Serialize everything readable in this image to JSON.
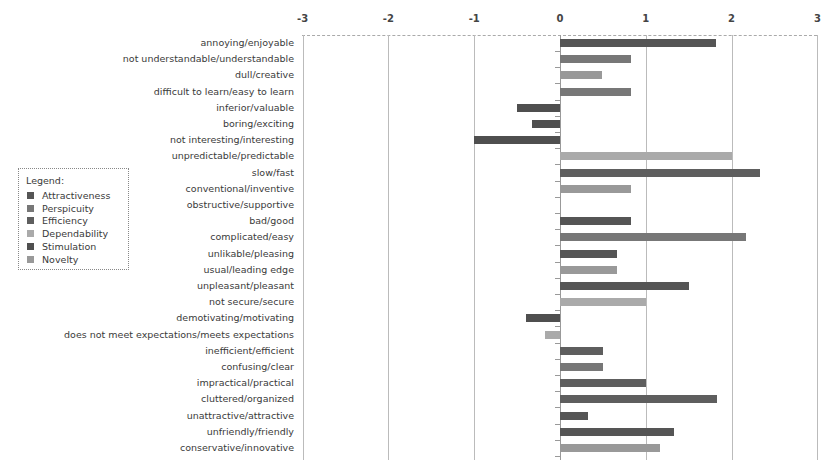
{
  "chart_data": {
    "type": "bar",
    "orientation": "horizontal",
    "title": "",
    "xlabel": "",
    "ylabel": "",
    "xlim": [
      -3,
      3
    ],
    "x_ticks": [
      "-3",
      "-2",
      "-1",
      "0",
      "1",
      "2",
      "3"
    ],
    "grid": true,
    "legend_position": "left",
    "legend_title": "Legend:",
    "scales": [
      {
        "name": "Attractiveness",
        "color": "#555555"
      },
      {
        "name": "Perspicuity",
        "color": "#777777"
      },
      {
        "name": "Efficiency",
        "color": "#5e5e5e"
      },
      {
        "name": "Dependability",
        "color": "#aaaaaa"
      },
      {
        "name": "Stimulation",
        "color": "#4f4f4f"
      },
      {
        "name": "Novelty",
        "color": "#999999"
      }
    ],
    "items": [
      {
        "label": "annoying/enjoyable",
        "value": 1.82,
        "scale": "Attractiveness"
      },
      {
        "label": "not understandable/understandable",
        "value": 0.83,
        "scale": "Perspicuity"
      },
      {
        "label": "dull/creative",
        "value": 0.49,
        "scale": "Novelty"
      },
      {
        "label": "difficult to learn/easy to learn",
        "value": 0.83,
        "scale": "Perspicuity"
      },
      {
        "label": "inferior/valuable",
        "value": -0.5,
        "scale": "Stimulation"
      },
      {
        "label": "boring/exciting",
        "value": -0.33,
        "scale": "Stimulation"
      },
      {
        "label": "not interesting/interesting",
        "value": -1.0,
        "scale": "Stimulation"
      },
      {
        "label": "unpredictable/predictable",
        "value": 2.0,
        "scale": "Dependability"
      },
      {
        "label": "slow/fast",
        "value": 2.33,
        "scale": "Efficiency"
      },
      {
        "label": "conventional/inventive",
        "value": 0.83,
        "scale": "Novelty"
      },
      {
        "label": "obstructive/supportive",
        "value": 0.0,
        "scale": "Dependability"
      },
      {
        "label": "bad/good",
        "value": 0.83,
        "scale": "Attractiveness"
      },
      {
        "label": "complicated/easy",
        "value": 2.17,
        "scale": "Perspicuity"
      },
      {
        "label": "unlikable/pleasing",
        "value": 0.67,
        "scale": "Attractiveness"
      },
      {
        "label": "usual/leading edge",
        "value": 0.67,
        "scale": "Novelty"
      },
      {
        "label": "unpleasant/pleasant",
        "value": 1.5,
        "scale": "Attractiveness"
      },
      {
        "label": "not secure/secure",
        "value": 1.0,
        "scale": "Dependability"
      },
      {
        "label": "demotivating/motivating",
        "value": -0.4,
        "scale": "Stimulation"
      },
      {
        "label": "does not meet expectations/meets expectations",
        "value": -0.17,
        "scale": "Dependability"
      },
      {
        "label": "inefficient/efficient",
        "value": 0.5,
        "scale": "Efficiency"
      },
      {
        "label": "confusing/clear",
        "value": 0.5,
        "scale": "Perspicuity"
      },
      {
        "label": "impractical/practical",
        "value": 1.0,
        "scale": "Efficiency"
      },
      {
        "label": "cluttered/organized",
        "value": 1.83,
        "scale": "Efficiency"
      },
      {
        "label": "unattractive/attractive",
        "value": 0.33,
        "scale": "Attractiveness"
      },
      {
        "label": "unfriendly/friendly",
        "value": 1.33,
        "scale": "Attractiveness"
      },
      {
        "label": "conservative/innovative",
        "value": 1.17,
        "scale": "Novelty"
      }
    ]
  }
}
